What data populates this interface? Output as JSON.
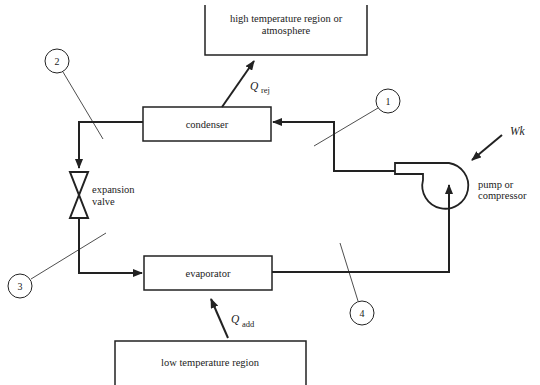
{
  "diagram": {
    "high_region": {
      "line1": "high temperature region or",
      "line2": "atmosphere"
    },
    "low_region": {
      "label": "low temperature region"
    },
    "condenser": {
      "label": "condenser"
    },
    "evaporator": {
      "label": "evaporator"
    },
    "expansion_valve": {
      "line1": "expansion",
      "line2": "valve"
    },
    "compressor": {
      "line1": "pump or",
      "line2": "compressor"
    },
    "q_rej": {
      "symbol": "Q",
      "subscript": "rej"
    },
    "q_add": {
      "symbol": "Q",
      "subscript": "add"
    },
    "work": {
      "label": "Wk"
    },
    "state_points": [
      {
        "label": "1"
      },
      {
        "label": "2"
      },
      {
        "label": "3"
      },
      {
        "label": "4"
      }
    ]
  }
}
